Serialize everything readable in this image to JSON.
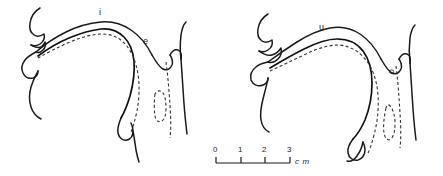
{
  "figure": {
    "type": "midsagittal-vocal-tract-tracings",
    "background_color": "#ffffff",
    "line_color": "#1a1a1a",
    "width": 443,
    "height": 176
  },
  "panels": [
    {
      "id": "left",
      "name": "front-vowels-panel",
      "labels": [
        {
          "text": "i",
          "contour_style": "solid",
          "x": 101,
          "y": 14,
          "rotated": false
        },
        {
          "text": "e",
          "contour_style": "dashed",
          "x": 145,
          "y": 43,
          "rotated": false
        }
      ]
    },
    {
      "id": "right",
      "name": "back-vowels-panel",
      "labels": [
        {
          "text": "u",
          "contour_style": "solid",
          "x": 321,
          "y": 29,
          "rotated": false
        },
        {
          "text": "o",
          "contour_style": "dashed",
          "x": 391,
          "y": 73,
          "rotated": true
        }
      ]
    }
  ],
  "scale_bar": {
    "name": "scale-bar",
    "ticks": [
      "0",
      "1",
      "2",
      "3"
    ],
    "unit": "c m",
    "tick_positions_px": [
      216,
      241,
      265,
      290
    ],
    "baseline_y_px": 163,
    "unit_x_px": 294,
    "unit_y_px": 163
  }
}
